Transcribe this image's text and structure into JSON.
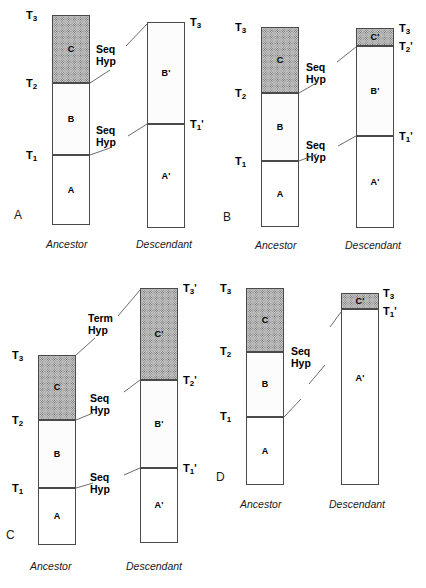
{
  "figure": {
    "background": "#ffffff",
    "ink": "#1a1a1a",
    "fills": {
      "blank": "#ffffff",
      "sparse_stipple": "#fcfcfc",
      "dense_stipple": "#c4c4c4"
    }
  },
  "labels": {
    "ancestor": "Ancestor",
    "descendant": "Descendant",
    "seq_hyp_line1": "Seq",
    "seq_hyp_line2": "Hyp",
    "term_hyp_line1": "Term",
    "term_hyp_line2": "Hyp"
  },
  "panels": [
    {
      "letter": "A",
      "ancestor": {
        "caption": "Ancestor",
        "units": [
          {
            "name": "C",
            "fill": "dense"
          },
          {
            "name": "B",
            "fill": "sparse"
          },
          {
            "name": "A",
            "fill": "blank"
          }
        ],
        "time_lines": [
          {
            "base": "T",
            "sub": "3",
            "prime": ""
          },
          {
            "base": "T",
            "sub": "2",
            "prime": ""
          },
          {
            "base": "T",
            "sub": "1",
            "prime": ""
          }
        ]
      },
      "descendant": {
        "caption": "Descendant",
        "units": [
          {
            "name": "B'",
            "fill": "sparse"
          },
          {
            "name": "A'",
            "fill": "blank"
          }
        ],
        "time_lines": [
          {
            "base": "T",
            "sub": "3",
            "prime": ""
          },
          {
            "base": "T",
            "sub": "1",
            "prime": "'"
          }
        ]
      },
      "hypotheses": [
        {
          "type": "seq",
          "line1": "Seq",
          "line2": "Hyp"
        },
        {
          "type": "seq",
          "line1": "Seq",
          "line2": "Hyp"
        }
      ]
    },
    {
      "letter": "B",
      "ancestor": {
        "caption": "Ancestor",
        "units": [
          {
            "name": "C",
            "fill": "dense"
          },
          {
            "name": "B",
            "fill": "sparse"
          },
          {
            "name": "A",
            "fill": "blank"
          }
        ],
        "time_lines": [
          {
            "base": "T",
            "sub": "3",
            "prime": ""
          },
          {
            "base": "T",
            "sub": "2",
            "prime": ""
          },
          {
            "base": "T",
            "sub": "1",
            "prime": ""
          }
        ]
      },
      "descendant": {
        "caption": "Descendant",
        "units": [
          {
            "name": "C'",
            "fill": "dense"
          },
          {
            "name": "B'",
            "fill": "sparse"
          },
          {
            "name": "A'",
            "fill": "blank"
          }
        ],
        "time_lines": [
          {
            "base": "T",
            "sub": "3",
            "prime": ""
          },
          {
            "base": "T",
            "sub": "2",
            "prime": "'"
          },
          {
            "base": "T",
            "sub": "1",
            "prime": "'"
          }
        ]
      },
      "hypotheses": [
        {
          "type": "seq",
          "line1": "Seq",
          "line2": "Hyp"
        },
        {
          "type": "seq",
          "line1": "Seq",
          "line2": "Hyp"
        }
      ]
    },
    {
      "letter": "C",
      "ancestor": {
        "caption": "Ancestor",
        "units": [
          {
            "name": "C",
            "fill": "dense"
          },
          {
            "name": "B",
            "fill": "sparse"
          },
          {
            "name": "A",
            "fill": "blank"
          }
        ],
        "time_lines": [
          {
            "base": "T",
            "sub": "3",
            "prime": ""
          },
          {
            "base": "T",
            "sub": "2",
            "prime": ""
          },
          {
            "base": "T",
            "sub": "1",
            "prime": ""
          }
        ]
      },
      "descendant": {
        "caption": "Descendant",
        "units": [
          {
            "name": "C'",
            "fill": "dense"
          },
          {
            "name": "B'",
            "fill": "sparse"
          },
          {
            "name": "A'",
            "fill": "blank"
          }
        ],
        "time_lines": [
          {
            "base": "T",
            "sub": "3",
            "prime": "'"
          },
          {
            "base": "T",
            "sub": "2",
            "prime": "'"
          },
          {
            "base": "T",
            "sub": "1",
            "prime": "'"
          }
        ]
      },
      "hypotheses": [
        {
          "type": "term",
          "line1": "Term",
          "line2": "Hyp"
        },
        {
          "type": "seq",
          "line1": "Seq",
          "line2": "Hyp"
        },
        {
          "type": "seq",
          "line1": "Seq",
          "line2": "Hyp"
        }
      ]
    },
    {
      "letter": "D",
      "ancestor": {
        "caption": "Ancestor",
        "units": [
          {
            "name": "C",
            "fill": "dense"
          },
          {
            "name": "B",
            "fill": "sparse"
          },
          {
            "name": "A",
            "fill": "blank"
          }
        ],
        "time_lines": [
          {
            "base": "T",
            "sub": "3",
            "prime": ""
          },
          {
            "base": "T",
            "sub": "2",
            "prime": ""
          },
          {
            "base": "T",
            "sub": "1",
            "prime": ""
          }
        ]
      },
      "descendant": {
        "caption": "Descendant",
        "units": [
          {
            "name": "C'",
            "fill": "dense"
          },
          {
            "name": "A'",
            "fill": "blank"
          }
        ],
        "time_lines": [
          {
            "base": "T",
            "sub": "3",
            "prime": ""
          },
          {
            "base": "T",
            "sub": "1",
            "prime": "'"
          }
        ]
      },
      "hypotheses": [
        {
          "type": "seq",
          "line1": "Seq",
          "line2": "Hyp"
        }
      ]
    }
  ]
}
